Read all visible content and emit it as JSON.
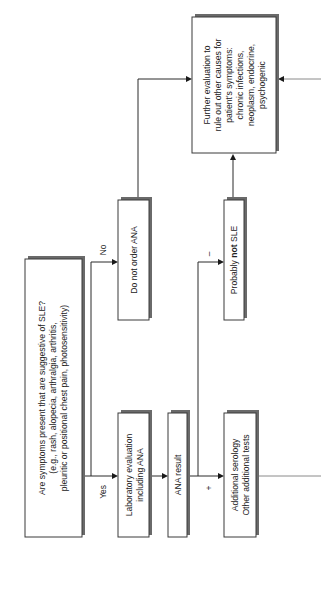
{
  "flowchart": {
    "question": {
      "lines": [
        "Are symptoms present that are suggestive of SLE?",
        "(e.g., rash, alopecia, arthralgia, arthritis,",
        "pleuritic or positional chest pain, photosensitivity)"
      ]
    },
    "branch_yes": "Yes",
    "branch_no": "No",
    "lab_eval": {
      "lines": [
        "Laboratory evaluation",
        "including ANA"
      ]
    },
    "ana_result": {
      "lines": [
        "ANA result"
      ]
    },
    "do_not_order": {
      "lines": [
        "Do not order ANA"
      ]
    },
    "positive_label": "+",
    "negative_label": "–",
    "additional": {
      "lines": [
        "Additional serology",
        "Other additional tests"
      ]
    },
    "probably_not": {
      "prefix": "Probably ",
      "bold": "not",
      "suffix": " SLE"
    },
    "further_eval": {
      "lines": [
        "Further evaluation to",
        "rule out other causes for",
        "patient's symptoms:",
        "chronic infections,",
        "neoplasm, endocrine,",
        "psychogenic"
      ]
    }
  }
}
